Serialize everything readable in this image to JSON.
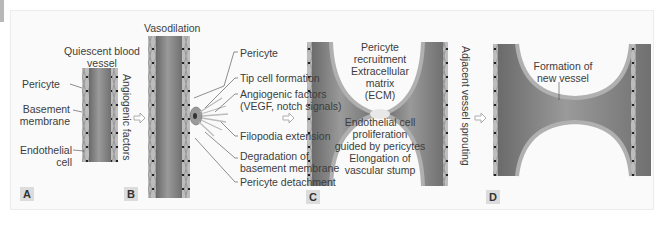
{
  "figure": {
    "panels": [
      {
        "id": "A",
        "letter": "A",
        "title": "Quiescent blood vessel",
        "title_line1": "Quiescent blood",
        "title_line2": "vessel",
        "labels": {
          "pericyte": "Pericyte",
          "basement_membrane_1": "Basement",
          "basement_membrane_2": "membrane",
          "endothelial_1": "Endothelial",
          "endothelial_2": "cell"
        },
        "transition_label": "Angiogenic factors"
      },
      {
        "id": "B",
        "letter": "B",
        "title": "Vasodilation",
        "labels": {
          "pericyte": "Pericyte",
          "tip_cell": "Tip cell formation",
          "angiogenic_1": "Angiogenic factors",
          "angiogenic_2": "(VEGF, notch signals)",
          "filopodia": "Filopodia extension",
          "degradation_1": "Degradation of",
          "degradation_2": "basement membrane",
          "detachment": "Pericyte detachment"
        }
      },
      {
        "id": "C",
        "letter": "C",
        "labels": {
          "recruitment_1": "Pericyte",
          "recruitment_2": "recruitment",
          "ecm_1": "Extracellular",
          "ecm_2": "matrix",
          "ecm_3": "(ECM)",
          "prolif_1": "Endothelial cell",
          "prolif_2": "proliferation",
          "prolif_3": "guided by pericytes",
          "elong_1": "Elongation of",
          "elong_2": "vascular stump"
        },
        "transition_label": "Adjacent vessel sprouting"
      },
      {
        "id": "D",
        "letter": "D",
        "labels": {
          "formation_1": "Formation of",
          "formation_2": "new vessel"
        }
      }
    ],
    "colors": {
      "vessel_dark": "#6b6b6b",
      "vessel_light": "#a8a8a8",
      "wall": "#b9b9b9",
      "background": "#fafafa",
      "text": "#3d3d3d"
    }
  }
}
